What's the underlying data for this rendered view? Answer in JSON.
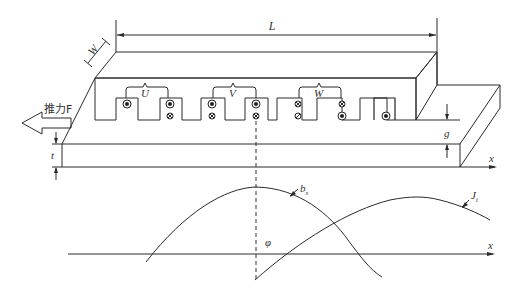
{
  "figure": {
    "type": "linear-motor-schematic",
    "dimension_labels": {
      "length": "L",
      "width": "W",
      "air_gap": "g",
      "secondary_thickness": "t"
    },
    "phases": [
      {
        "label": "U"
      },
      {
        "label": "V"
      },
      {
        "label": "W"
      }
    ],
    "thrust_label": "推力F",
    "axis_label_secondary": "x",
    "conductor_marks": [
      {
        "slot": 1,
        "top": "dot",
        "bottom": ""
      },
      {
        "slot": 2,
        "top": "dot",
        "bottom": "cross"
      },
      {
        "slot": 3,
        "top": "dot",
        "bottom": "cross"
      },
      {
        "slot": 4,
        "top": "dot",
        "bottom": "cross"
      },
      {
        "slot": 5,
        "top": "cross",
        "bottom": "cross"
      },
      {
        "slot": 6,
        "top": "cross",
        "bottom": "dot"
      },
      {
        "slot": 7,
        "top": "",
        "bottom": "dot"
      }
    ]
  },
  "waveforms": {
    "axis_label": "x",
    "phase_angle_label": "φ",
    "curves": [
      {
        "name": "b_s",
        "label_main": "b",
        "label_sub": "s",
        "description": "air-gap flux density wave"
      },
      {
        "name": "J_t",
        "label_main": "J",
        "label_sub": "t",
        "description": "secondary current density wave"
      }
    ]
  }
}
